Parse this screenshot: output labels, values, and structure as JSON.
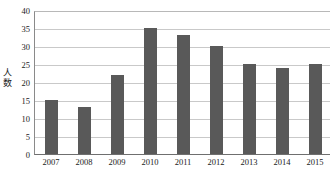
{
  "chart_data": {
    "type": "bar",
    "title": "",
    "subtitle": "",
    "xlabel": "",
    "ylabel": "人数",
    "categories": [
      "2007",
      "2008",
      "2009",
      "2010",
      "2011",
      "2012",
      "2013",
      "2014",
      "2015"
    ],
    "values": [
      15,
      13,
      22,
      35,
      33,
      30,
      25,
      24,
      25
    ],
    "series": [
      {
        "name": "人数",
        "values": [
          15,
          13,
          22,
          35,
          33,
          30,
          25,
          24,
          25
        ]
      }
    ],
    "ylim": [
      0,
      40
    ],
    "ytick_labels": [
      "0",
      "5",
      "10",
      "15",
      "20",
      "25",
      "30",
      "35",
      "40"
    ],
    "ytick_values": [
      0,
      5,
      10,
      15,
      20,
      25,
      30,
      35,
      40
    ],
    "grid": true,
    "grid_axis": "y",
    "legend": false,
    "legend_position": "none",
    "bar_color": "#595959",
    "gridline_color": "#c9c9c9",
    "axis_color": "#6f6f6f",
    "background_color": "#ffffff"
  },
  "axis": {
    "y_title_chars": [
      "人",
      "数"
    ]
  },
  "caption": {
    "text": ""
  }
}
